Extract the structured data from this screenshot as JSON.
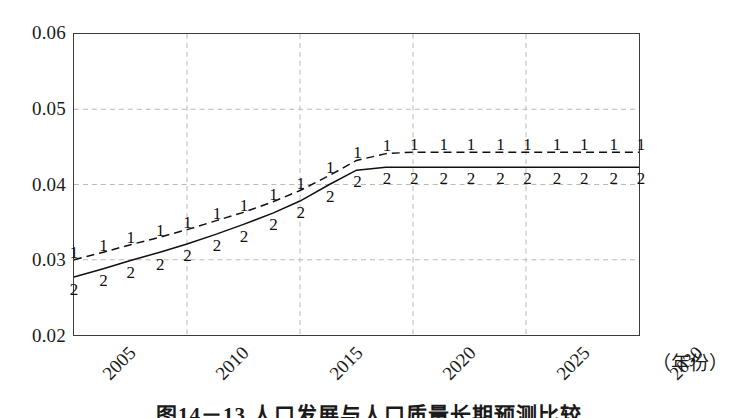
{
  "chart_data": {
    "type": "line",
    "title": "",
    "xlabel": "（年份）",
    "ylabel": "",
    "xlim": [
      2005,
      2030
    ],
    "ylim": [
      0.02,
      0.06
    ],
    "grid": true,
    "legend_position": "inline-markers",
    "y_ticks": [
      "0.06",
      "0.05",
      "0.04",
      "0.03",
      "0.02"
    ],
    "y_tick_values": [
      0.06,
      0.05,
      0.04,
      0.03,
      0.02
    ],
    "x_ticks": [
      "2005",
      "2010",
      "2015",
      "2020",
      "2025",
      "2030"
    ],
    "x_tick_values": [
      2005,
      2010,
      2015,
      2020,
      2025,
      2030
    ],
    "series": [
      {
        "name": "1",
        "marker_label": "1",
        "style": "dashed",
        "x": [
          2005,
          2006.3,
          2007.5,
          2008.8,
          2010,
          2011.3,
          2012.5,
          2013.8,
          2015,
          2016.3,
          2017.5,
          2018.8,
          2020,
          2021.3,
          2022.5,
          2023.8,
          2025,
          2026.3,
          2027.5,
          2028.8,
          2030
        ],
        "values": [
          0.03,
          0.031,
          0.032,
          0.033,
          0.034,
          0.0352,
          0.0363,
          0.0377,
          0.0392,
          0.0412,
          0.0432,
          0.0441,
          0.0443,
          0.0443,
          0.0443,
          0.0443,
          0.0443,
          0.0443,
          0.0443,
          0.0443,
          0.0443
        ]
      },
      {
        "name": "2",
        "marker_label": "2",
        "style": "solid",
        "x": [
          2005,
          2006.3,
          2007.5,
          2008.8,
          2010,
          2011.3,
          2012.5,
          2013.8,
          2015,
          2016.3,
          2017.5,
          2018.8,
          2020,
          2021.3,
          2022.5,
          2023.8,
          2025,
          2026.3,
          2027.5,
          2028.8,
          2030
        ],
        "values": [
          0.0277,
          0.0288,
          0.0299,
          0.031,
          0.0321,
          0.0334,
          0.0347,
          0.0362,
          0.0378,
          0.04,
          0.0419,
          0.0423,
          0.0423,
          0.0423,
          0.0423,
          0.0423,
          0.0423,
          0.0423,
          0.0423,
          0.0423,
          0.0423
        ]
      }
    ]
  },
  "caption": {
    "text": "图14－13 人口发展与人口质量长期预测比较"
  },
  "colors": {
    "axis": "#3b3b3b",
    "grid": "#b8b8b8",
    "series1": "#101010",
    "series2": "#101010",
    "text": "#1a1a1a"
  }
}
